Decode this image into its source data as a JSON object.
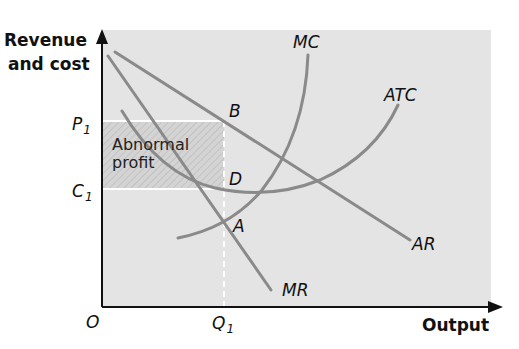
{
  "diagram": {
    "y_axis_label_line1": "Revenue",
    "y_axis_label_line2": "and cost",
    "x_axis_label": "Output",
    "origin_label": "O",
    "ticks": {
      "p1": {
        "main": "P",
        "sub": "1"
      },
      "c1": {
        "main": "C",
        "sub": "1"
      },
      "q1": {
        "main": "Q",
        "sub": "1"
      }
    },
    "curves": {
      "mc": "MC",
      "atc": "ATC",
      "ar": "AR",
      "mr": "MR"
    },
    "points": {
      "a": "A",
      "b": "B",
      "d": "D"
    },
    "region": {
      "line1": "Abnormal",
      "line2": "profit"
    },
    "colors": {
      "background": "#e4e4e4",
      "curve": "#8a8a8a",
      "profit_area": "#cfcfcf",
      "axis": "#111111"
    }
  }
}
